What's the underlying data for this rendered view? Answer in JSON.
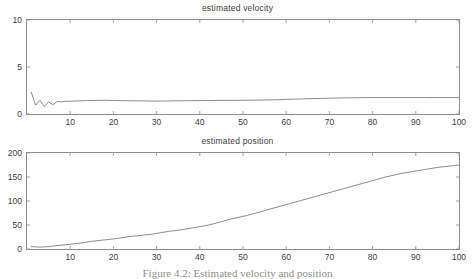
{
  "figure": {
    "caption": "Figure 4.2: Estimated velocity and position",
    "background_color": "#ffffff",
    "axis_color": "#8d8d8d",
    "line_color": "#6e6e6e",
    "text_color": "#3c3c3c"
  },
  "chart_data": [
    {
      "type": "line",
      "id": "estimated-velocity",
      "title": "estimated velocity",
      "xlabel": "",
      "ylabel": "",
      "xlim": [
        0,
        100
      ],
      "ylim": [
        0,
        10
      ],
      "xticks": [
        10,
        20,
        30,
        40,
        50,
        60,
        70,
        80,
        90,
        100
      ],
      "yticks": [
        0,
        5,
        10
      ],
      "xtick_labels": [
        "10",
        "20",
        "30",
        "40",
        "50",
        "60",
        "70",
        "80",
        "90",
        "100"
      ],
      "ytick_labels": [
        "0",
        "5",
        "10"
      ],
      "grid": false,
      "legend": null,
      "series": [
        {
          "name": "estimated velocity",
          "x": [
            1,
            2,
            3,
            4,
            5,
            6,
            7,
            8,
            9,
            10,
            12,
            14,
            16,
            18,
            20,
            22,
            24,
            26,
            28,
            30,
            32,
            34,
            36,
            38,
            40,
            42,
            44,
            46,
            48,
            50,
            52,
            54,
            56,
            58,
            60,
            62,
            64,
            66,
            68,
            70,
            72,
            74,
            76,
            78,
            80,
            82,
            84,
            86,
            88,
            90,
            92,
            94,
            96,
            98,
            100
          ],
          "values": [
            2.3,
            0.95,
            1.45,
            0.82,
            1.28,
            1.0,
            1.32,
            1.3,
            1.35,
            1.36,
            1.4,
            1.43,
            1.45,
            1.46,
            1.44,
            1.42,
            1.41,
            1.4,
            1.38,
            1.37,
            1.38,
            1.4,
            1.41,
            1.42,
            1.43,
            1.43,
            1.44,
            1.45,
            1.45,
            1.46,
            1.47,
            1.48,
            1.5,
            1.52,
            1.55,
            1.58,
            1.61,
            1.64,
            1.66,
            1.68,
            1.7,
            1.72,
            1.73,
            1.74,
            1.75,
            1.75,
            1.75,
            1.75,
            1.75,
            1.75,
            1.75,
            1.75,
            1.75,
            1.75,
            1.75
          ]
        }
      ]
    },
    {
      "type": "line",
      "id": "estimated-position",
      "title": "estimated position",
      "xlabel": "",
      "ylabel": "",
      "xlim": [
        0,
        100
      ],
      "ylim": [
        0,
        200
      ],
      "xticks": [
        10,
        20,
        30,
        40,
        50,
        60,
        70,
        80,
        90,
        100
      ],
      "yticks": [
        0,
        50,
        100,
        150,
        200
      ],
      "xtick_labels": [
        "10",
        "20",
        "30",
        "40",
        "50",
        "60",
        "70",
        "80",
        "90",
        "100"
      ],
      "ytick_labels": [
        "0",
        "50",
        "100",
        "150",
        "200"
      ],
      "grid": false,
      "legend": null,
      "series": [
        {
          "name": "estimated position",
          "x": [
            1,
            3,
            5,
            7,
            9,
            11,
            13,
            15,
            17,
            19,
            21,
            23,
            25,
            27,
            29,
            31,
            33,
            35,
            37,
            39,
            41,
            43,
            45,
            47,
            49,
            51,
            53,
            55,
            57,
            59,
            61,
            63,
            65,
            67,
            69,
            71,
            73,
            75,
            77,
            79,
            81,
            83,
            85,
            87,
            89,
            91,
            93,
            95,
            97,
            99,
            100
          ],
          "values": [
            5,
            4,
            5,
            7,
            9,
            11,
            13,
            16,
            18,
            20,
            22,
            25,
            27,
            29,
            31,
            34,
            37,
            39,
            42,
            45,
            48,
            52,
            57,
            62,
            66,
            70,
            75,
            80,
            85,
            90,
            95,
            100,
            105,
            110,
            115,
            120,
            125,
            130,
            135,
            140,
            145,
            150,
            154,
            158,
            161,
            164,
            167,
            170,
            172,
            174,
            175
          ]
        }
      ]
    }
  ]
}
